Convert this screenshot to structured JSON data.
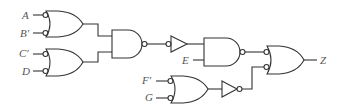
{
  "diagram": {
    "type": "logic-circuit",
    "line_color": "#333333",
    "label_color": "#555555",
    "inputs": [
      {
        "id": "A",
        "label": "A",
        "x": 22,
        "y": 10
      },
      {
        "id": "Bp",
        "label": "B′",
        "x": 20,
        "y": 28
      },
      {
        "id": "Cp",
        "label": "C′",
        "x": 19,
        "y": 48
      },
      {
        "id": "D",
        "label": "D",
        "x": 22,
        "y": 66
      },
      {
        "id": "E",
        "label": "E",
        "x": 182,
        "y": 55
      },
      {
        "id": "Fp",
        "label": "F′",
        "x": 142,
        "y": 74
      },
      {
        "id": "G",
        "label": "G",
        "x": 145,
        "y": 92
      }
    ],
    "output": {
      "id": "Z",
      "label": "Z",
      "x": 320,
      "y": 55
    },
    "gates": [
      {
        "name": "or-gate-1",
        "kind": "OR",
        "inverted_inputs": true
      },
      {
        "name": "or-gate-2",
        "kind": "OR",
        "inverted_inputs": true
      },
      {
        "name": "nand-gate-1",
        "kind": "NAND"
      },
      {
        "name": "buffer-1",
        "kind": "BUFFER",
        "inverted_input": true
      },
      {
        "name": "nand-gate-2",
        "kind": "NAND"
      },
      {
        "name": "or-gate-3",
        "kind": "OR",
        "inverted_inputs": true
      },
      {
        "name": "not-gate-1",
        "kind": "NOT"
      },
      {
        "name": "or-gate-4",
        "kind": "OR",
        "inverted_inputs": true
      }
    ]
  }
}
